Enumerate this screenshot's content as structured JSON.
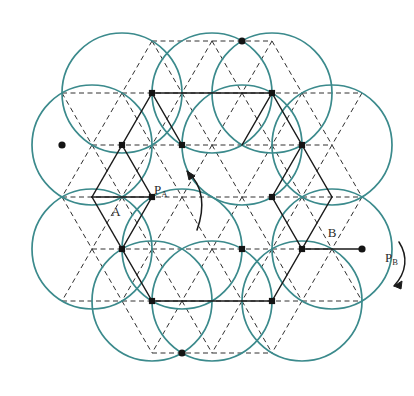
{
  "figure": {
    "title": "",
    "domain_type": "diagram",
    "background_color": "#ffffff",
    "width": 414,
    "height": 396
  },
  "style": {
    "circle_stroke": "#3b8a8c",
    "circle_stroke_width": 1.7,
    "solid_edge_color": "#1a1a1a",
    "solid_edge_width": 1.5,
    "dashed_edge_color": "#303030",
    "dashed_edge_width": 1.0,
    "dash_pattern": "5,3.5",
    "node_fill": "#141414",
    "square_node_size": 6.2,
    "round_node_radius": 3.6,
    "arrow_color": "#1a1a1a",
    "label_color": "#2a2a2a"
  },
  "lattice": {
    "description": "triangular lattice, spacing 60px horizontal, 51.96px row height",
    "spacing_x": 60,
    "row_height": 51.96,
    "origin_x": 32,
    "origin_y": 41.3
  },
  "labels": [
    {
      "id": "label-p-a",
      "text": "P",
      "sub": "A",
      "x": 154,
      "y": 194,
      "anchor": "start"
    },
    {
      "id": "label-p-b",
      "text": "P",
      "sub": "B",
      "x": 385,
      "y": 262,
      "anchor": "start"
    },
    {
      "id": "label-a",
      "text": "A",
      "sub": "",
      "x": 116,
      "y": 216,
      "anchor": "middle"
    },
    {
      "id": "label-b",
      "text": "B",
      "sub": "",
      "x": 332,
      "y": 237,
      "anchor": "middle"
    }
  ],
  "arrows": [
    {
      "id": "arrow-rotate-left",
      "direction": "counterclockwise",
      "path": "M 197 230 C 205 208 204 186 187 171",
      "head": "M 187 171 L 195 176 L 189 180 Z"
    },
    {
      "id": "arrow-rotate-right",
      "direction": "clockwise",
      "path": "M 399 242 C 408 256 407 272 394 286",
      "head": "M 394 286 L 402 281 L 401 289 Z"
    }
  ],
  "circles": [
    {
      "id": "circle-1",
      "cx": 92,
      "cy": 145,
      "r": 60
    },
    {
      "id": "circle-2",
      "cx": 122,
      "cy": 93,
      "r": 60
    },
    {
      "id": "circle-3",
      "cx": 212,
      "cy": 93,
      "r": 60
    },
    {
      "id": "circle-4",
      "cx": 242,
      "cy": 145,
      "r": 60
    },
    {
      "id": "circle-5",
      "cx": 272,
      "cy": 93,
      "r": 60
    },
    {
      "id": "circle-6",
      "cx": 332,
      "cy": 145,
      "r": 60
    },
    {
      "id": "circle-7",
      "cx": 332,
      "cy": 249,
      "r": 60
    },
    {
      "id": "circle-8",
      "cx": 302,
      "cy": 301,
      "r": 60
    },
    {
      "id": "circle-9",
      "cx": 212,
      "cy": 301,
      "r": 60
    },
    {
      "id": "circle-10",
      "cx": 182,
      "cy": 249,
      "r": 60
    },
    {
      "id": "circle-11",
      "cx": 152,
      "cy": 301,
      "r": 60
    },
    {
      "id": "circle-12",
      "cx": 92,
      "cy": 249,
      "r": 60
    }
  ],
  "nodes": [
    {
      "id": "n-62-145",
      "x": 62,
      "y": 145,
      "shape": "round"
    },
    {
      "id": "n-122-145",
      "x": 122,
      "y": 145,
      "shape": "square"
    },
    {
      "id": "n-182-145",
      "x": 182,
      "y": 145,
      "shape": "square"
    },
    {
      "id": "n-152-93",
      "x": 152,
      "y": 93,
      "shape": "square"
    },
    {
      "id": "n-272-93",
      "x": 272,
      "y": 93,
      "shape": "square"
    },
    {
      "id": "n-242-41",
      "x": 242,
      "y": 41,
      "shape": "round"
    },
    {
      "id": "n-302-145",
      "x": 302,
      "y": 145,
      "shape": "square"
    },
    {
      "id": "n-272-197",
      "x": 272,
      "y": 197,
      "shape": "square"
    },
    {
      "id": "n-152-197",
      "x": 152,
      "y": 197,
      "shape": "square"
    },
    {
      "id": "n-122-249",
      "x": 122,
      "y": 249,
      "shape": "square"
    },
    {
      "id": "n-242-249",
      "x": 242,
      "y": 249,
      "shape": "square"
    },
    {
      "id": "n-302-249",
      "x": 302,
      "y": 249,
      "shape": "square"
    },
    {
      "id": "n-362-249",
      "x": 362,
      "y": 249,
      "shape": "round"
    },
    {
      "id": "n-152-301",
      "x": 152,
      "y": 301,
      "shape": "square"
    },
    {
      "id": "n-272-301",
      "x": 272,
      "y": 301,
      "shape": "square"
    },
    {
      "id": "n-182-353",
      "x": 182,
      "y": 353,
      "shape": "round"
    }
  ],
  "solid_edges": [
    {
      "x1": 152,
      "y1": 93,
      "x2": 272,
      "y2": 93
    },
    {
      "x1": 122,
      "y1": 145,
      "x2": 152,
      "y2": 93
    },
    {
      "x1": 152,
      "y1": 93,
      "x2": 182,
      "y2": 145
    },
    {
      "x1": 272,
      "y1": 93,
      "x2": 302,
      "y2": 145
    },
    {
      "x1": 272,
      "y1": 93,
      "x2": 242,
      "y2": 145
    },
    {
      "x1": 122,
      "y1": 145,
      "x2": 152,
      "y2": 197
    },
    {
      "x1": 122,
      "y1": 145,
      "x2": 92,
      "y2": 197
    },
    {
      "x1": 92,
      "y1": 197,
      "x2": 152,
      "y2": 197
    },
    {
      "x1": 152,
      "y1": 197,
      "x2": 122,
      "y2": 249
    },
    {
      "x1": 92,
      "y1": 197,
      "x2": 122,
      "y2": 249
    },
    {
      "x1": 122,
      "y1": 249,
      "x2": 152,
      "y2": 301
    },
    {
      "x1": 152,
      "y1": 301,
      "x2": 272,
      "y2": 301
    },
    {
      "x1": 302,
      "y1": 145,
      "x2": 332,
      "y2": 197
    },
    {
      "x1": 302,
      "y1": 145,
      "x2": 272,
      "y2": 197
    },
    {
      "x1": 332,
      "y1": 197,
      "x2": 302,
      "y2": 249
    },
    {
      "x1": 272,
      "y1": 197,
      "x2": 302,
      "y2": 249
    },
    {
      "x1": 302,
      "y1": 249,
      "x2": 362,
      "y2": 249
    },
    {
      "x1": 272,
      "y1": 301,
      "x2": 302,
      "y2": 249
    }
  ],
  "dashed_edges_note": "remaining triangular-lattice edges rendered as dashed"
}
